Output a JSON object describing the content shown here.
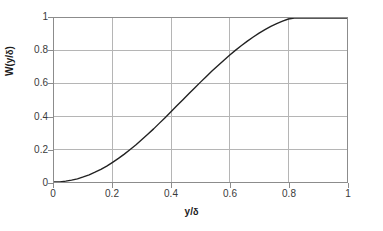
{
  "chart_data": {
    "type": "line",
    "title": "",
    "subtitle": "",
    "xlabel": "y/δ",
    "ylabel": "W(y/δ)",
    "xlim": [
      0,
      1
    ],
    "ylim": [
      0,
      1
    ],
    "grid": true,
    "legend": null,
    "legend_position": "none",
    "x_ticks": [
      "0",
      "0.2",
      "0.4",
      "0.6",
      "0.8",
      "1"
    ],
    "x_tick_values": [
      0,
      0.2,
      0.4,
      0.6,
      0.8,
      1
    ],
    "y_ticks": [
      "0",
      "0.2",
      "0.4",
      "0.6",
      "0.8",
      "1"
    ],
    "y_tick_values": [
      0,
      0.2,
      0.4,
      0.6,
      0.8,
      1
    ],
    "series": [
      {
        "name": "Coles wake function",
        "color": "#222222",
        "x": [
          0.0,
          0.02,
          0.04,
          0.06,
          0.08,
          0.1,
          0.12,
          0.14,
          0.16,
          0.18,
          0.2,
          0.22,
          0.24,
          0.26,
          0.28,
          0.3,
          0.32,
          0.34,
          0.36,
          0.38,
          0.4,
          0.42,
          0.44,
          0.46,
          0.48,
          0.5,
          0.52,
          0.54,
          0.56,
          0.58,
          0.6,
          0.62,
          0.64,
          0.66,
          0.68,
          0.7,
          0.72,
          0.74,
          0.76,
          0.78,
          0.8,
          0.82,
          0.84,
          0.86,
          0.88,
          0.9,
          0.92,
          0.94,
          0.96,
          0.98,
          1.0
        ],
        "y": [
          0.0,
          0.002,
          0.008,
          0.018,
          0.031,
          0.049,
          0.07,
          0.095,
          0.123,
          0.155,
          0.191,
          0.229,
          0.271,
          0.315,
          0.362,
          0.412,
          0.463,
          0.516,
          0.571,
          0.627,
          0.684,
          0.741,
          0.798,
          0.856,
          0.912,
          0.968,
          1.024,
          1.078,
          1.131,
          1.183,
          1.232,
          1.28,
          1.325,
          1.368,
          1.408,
          1.445,
          1.479,
          1.51,
          1.537,
          1.561,
          1.582,
          1.599,
          1.613,
          1.623,
          1.629,
          1.631,
          1.631,
          1.627,
          1.619,
          1.608,
          1.594
        ]
      }
    ],
    "formula": "W(y/δ) = 1 − cos(π y/δ)",
    "normalized_y": [
      0.0,
      0.001,
      0.005,
      0.011,
      0.019,
      0.031,
      0.044,
      0.06,
      0.077,
      0.097,
      0.12,
      0.144,
      0.17,
      0.198,
      0.227,
      0.259,
      0.291,
      0.324,
      0.359,
      0.394,
      0.43,
      0.466,
      0.502,
      0.538,
      0.573,
      0.609,
      0.644,
      0.678,
      0.711,
      0.743,
      0.774,
      0.804,
      0.832,
      0.859,
      0.884,
      0.908,
      0.929,
      0.949,
      0.966,
      0.981,
      0.994,
      1.0,
      1.0,
      1.0,
      1.0,
      1.0,
      1.0,
      1.0,
      1.0,
      1.0,
      1.0
    ]
  },
  "axes": {
    "x_tick_labels": [
      "0",
      "0.2",
      "0.4",
      "0.6",
      "0.8",
      "1"
    ],
    "y_tick_labels": [
      "0",
      "0.2",
      "0.4",
      "0.6",
      "0.8",
      "1"
    ],
    "x_axis_title": "y/δ",
    "y_axis_title": "W(y/δ)"
  },
  "colors": {
    "curve": "#222222",
    "grid": "#b4b4b4",
    "frame": "#8c8c8c",
    "tick_text": "#3a3a3a",
    "axis_title": "#1c1c1c",
    "background": "#ffffff"
  }
}
